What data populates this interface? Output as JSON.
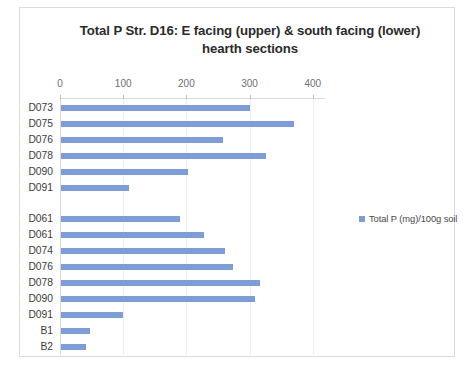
{
  "chart_data": {
    "type": "bar",
    "orientation": "horizontal",
    "title": "Total P Str. D16: E facing (upper) & south facing (lower) hearth sections",
    "title_lines": [
      "Total P Str. D16: E facing (upper) & south facing (lower)",
      "hearth sections"
    ],
    "xlabel": "",
    "ylabel": "",
    "xlim": [
      0,
      445
    ],
    "x_ticks": [
      0,
      100,
      200,
      300,
      400
    ],
    "x_tick_labels": [
      "0",
      "100",
      "200",
      "300",
      "400"
    ],
    "grid": true,
    "grid_axis": "x",
    "legend_position": "right",
    "legend": [
      "Total P (mg)/100g soil"
    ],
    "series": [
      {
        "name": "Total P (mg)/100g soil",
        "color": "#7e9cd6",
        "values": [
          299,
          369,
          256,
          324,
          201,
          108,
          null,
          188,
          226,
          259,
          272,
          315,
          307,
          98,
          46,
          40
        ]
      }
    ],
    "categories": [
      "D073",
      "D075",
      "D076",
      "D078",
      "D090",
      "D091",
      "",
      "D061",
      "D061",
      "D074",
      "D076",
      "D078",
      "D090",
      "D091",
      "B1",
      "B2"
    ],
    "groups": [
      {
        "label": "E facing (upper)",
        "categories": [
          "D073",
          "D075",
          "D076",
          "D078",
          "D090",
          "D091"
        ]
      },
      {
        "label": "south facing (lower)",
        "categories": [
          "D061",
          "D061",
          "D074",
          "D076",
          "D078",
          "D090",
          "D091",
          "B1",
          "B2"
        ]
      }
    ]
  },
  "colors": {
    "bar": "#7e9cd6",
    "grid": "#eeeeee",
    "axis": "#d9d9d9",
    "frame": "#dcdcdc",
    "title_text": "#2b2b2b",
    "tick_text": "#6f6f6f",
    "category_text": "#3c3c3c",
    "legend_text": "#4a4a4a",
    "background": "#ffffff"
  }
}
